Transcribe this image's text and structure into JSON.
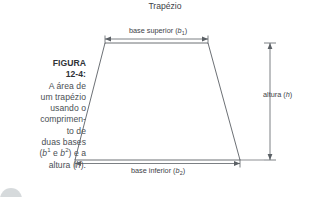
{
  "figure": {
    "title": "Trapézio",
    "caption": {
      "label_line1": "FIGURA",
      "label_line2": "12-4:",
      "lines": [
        "A área de",
        "um trapézio",
        "usando o",
        "comprimen-",
        "to de",
        "duas bases"
      ],
      "line_bases_prefix": "(",
      "line_bases_b1": "b",
      "line_bases_b1_sup": "1",
      "line_bases_mid": " e ",
      "line_bases_b2": "b",
      "line_bases_b2_sup": "2",
      "line_bases_suffix": ") e a",
      "line_altura_prefix": "altura (",
      "line_altura_var": "h",
      "line_altura_suffix": ")."
    },
    "dimensions": {
      "top_base_prefix": "base superior (",
      "top_base_var": "b",
      "top_base_sub": "1",
      "top_base_suffix": ")",
      "bottom_base_prefix": "base inferior (",
      "bottom_base_var": "b",
      "bottom_base_sub": "2",
      "bottom_base_suffix": ")",
      "height_prefix": "altura (",
      "height_var": "h",
      "height_suffix": ")"
    },
    "colors": {
      "shape_stroke": "#5b6065",
      "dimension_stroke": "#5b6065",
      "text": "#3d4247",
      "caption_text": "#4a4f54",
      "caption_bold": "#2f3337",
      "background": "#ffffff"
    },
    "geometry": {
      "top_left": [
        105,
        43
      ],
      "top_right": [
        208,
        43
      ],
      "bottom_left": [
        75,
        160
      ],
      "bottom_right": [
        240,
        160
      ]
    }
  }
}
